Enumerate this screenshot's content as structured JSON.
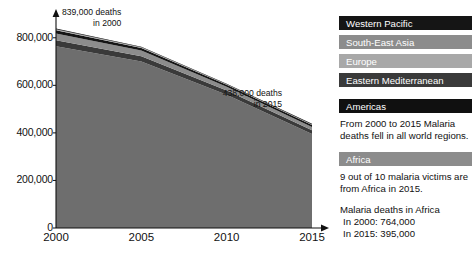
{
  "chart_data": {
    "type": "area",
    "stacked": true,
    "title": "",
    "xlabel": "",
    "ylabel": "",
    "x": [
      2000,
      2005,
      2010,
      2015
    ],
    "xlim": [
      2000,
      2015
    ],
    "ylim": [
      0,
      900000
    ],
    "xticks": [
      "2000",
      "2005",
      "2010",
      "2015"
    ],
    "yticks": [
      "0",
      "200,000",
      "400,000",
      "600,000",
      "800,000"
    ],
    "ytick_values": [
      0,
      200000,
      400000,
      600000,
      800000
    ],
    "grid": false,
    "legend_position": "right",
    "series": [
      {
        "name": "Africa",
        "color": "#6e6e6e",
        "values": [
          764000,
          700000,
          560000,
          395000
        ]
      },
      {
        "name": "Eastern Mediterranean",
        "color": "#3a3a3a",
        "values": [
          26000,
          22000,
          18000,
          16000
        ]
      },
      {
        "name": "South-East Asia",
        "color": "#8c8c8c",
        "values": [
          28000,
          24000,
          16000,
          14000
        ]
      },
      {
        "name": "Western Pacific",
        "color": "#151515",
        "values": [
          14000,
          11000,
          8000,
          8000
        ]
      },
      {
        "name": "Europe",
        "color": "#a8a8a8",
        "values": [
          4000,
          3000,
          2500,
          2500
        ]
      },
      {
        "name": "Americas",
        "color": "#101010",
        "values": [
          3000,
          2500,
          2500,
          2500
        ]
      }
    ],
    "totals": {
      "2000": 839000,
      "2015": 438000
    },
    "annotations": [
      {
        "id": "annot-2000",
        "line1": "839,000 deaths",
        "line2": "in 2000"
      },
      {
        "id": "annot-2015",
        "line1": "438,000 deaths",
        "line2": "in 2015"
      }
    ]
  },
  "legend": {
    "items": [
      {
        "label": "Western Pacific",
        "color": "#151515",
        "text_color": "#ffffff"
      },
      {
        "label": "South-East Asia",
        "color": "#8c8c8c",
        "text_color": "#ffffff"
      },
      {
        "label": "Europe",
        "color": "#a8a8a8",
        "text_color": "#ffffff"
      },
      {
        "label": "Eastern Mediterranean",
        "color": "#3a3a3a",
        "text_color": "#ffffff"
      },
      {
        "label": "Americas",
        "color": "#101010",
        "text_color": "#ffffff"
      },
      {
        "label": "Africa",
        "color": "#8c8c8c",
        "text_color": "#ffffff"
      }
    ]
  },
  "panel": {
    "note_regions": "From 2000 to 2015 Malaria deaths fell in all world regions.",
    "note_africa_share": "9 out of 10 malaria victims are from Africa in 2015.",
    "africa_heading": "Malaria deaths in Africa",
    "africa_2000": "In 2000: 764,000",
    "africa_2015": "In 2015: 395,000"
  },
  "axis": {
    "plot_left": 56,
    "plot_right": 312,
    "plot_top": 14,
    "plot_bottom": 228
  }
}
